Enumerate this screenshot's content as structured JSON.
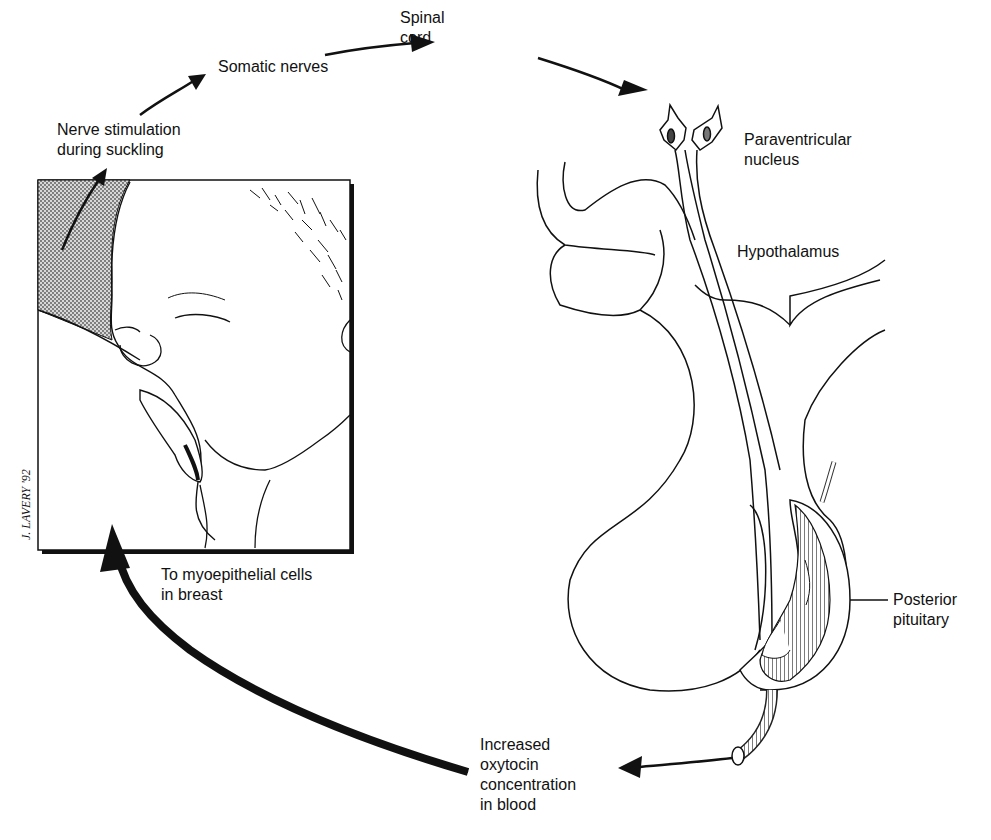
{
  "diagram": {
    "colors": {
      "ink": "#111111",
      "shading": "#9a9a9a",
      "background": "#ffffff"
    },
    "labels": {
      "nerve_stimulation": {
        "line1": "Nerve stimulation",
        "line2": "during suckling"
      },
      "somatic_nerves": {
        "line1": "Somatic nerves"
      },
      "spinal_cord": {
        "line1": "Spinal",
        "line2": "cord"
      },
      "paraventricular_nucleus": {
        "line1": "Paraventricular",
        "line2": "nucleus"
      },
      "hypothalamus": {
        "line1": "Hypothalamus"
      },
      "posterior_pituitary": {
        "line1": "Posterior",
        "line2": "pituitary"
      },
      "increased_oxytocin": {
        "line1": "Increased",
        "line2": "oxytocin",
        "line3": "concentration",
        "line4": "in blood"
      },
      "to_myoepithelial": {
        "line1": "To myoepithelial cells",
        "line2": "in breast"
      }
    },
    "signature": "J. LAVERY '92",
    "flow": [
      "Nerve stimulation during suckling",
      "Somatic nerves",
      "Spinal cord",
      "Paraventricular nucleus",
      "Posterior pituitary",
      "Increased oxytocin concentration in blood",
      "To myoepithelial cells in breast"
    ]
  }
}
